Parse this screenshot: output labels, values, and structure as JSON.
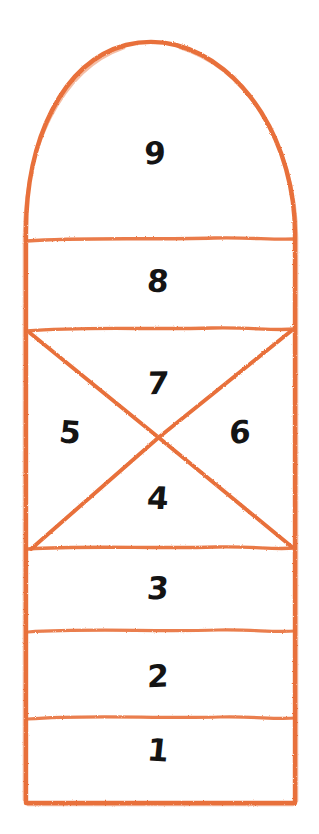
{
  "diagram": {
    "ink_color": "#E8703A",
    "number_color": "#141414",
    "background_color": "#FFFFFF",
    "canvas": {
      "width": 319,
      "height": 834
    },
    "cells": [
      {
        "label": "9",
        "x": 155,
        "y": 155,
        "shape": "arched-top",
        "region": "top-arch"
      },
      {
        "label": "8",
        "x": 158,
        "y": 283,
        "shape": "rectangle",
        "region": "single"
      },
      {
        "label": "7",
        "x": 158,
        "y": 385,
        "shape": "triangle-up",
        "region": "x-box-top"
      },
      {
        "label": "5",
        "x": 70,
        "y": 434,
        "shape": "triangle-left",
        "region": "x-box-left"
      },
      {
        "label": "6",
        "x": 240,
        "y": 434,
        "shape": "triangle-right",
        "region": "x-box-right"
      },
      {
        "label": "4",
        "x": 158,
        "y": 500,
        "shape": "triangle-down",
        "region": "x-box-bottom"
      },
      {
        "label": "3",
        "x": 158,
        "y": 590,
        "shape": "rectangle",
        "region": "single"
      },
      {
        "label": "2",
        "x": 158,
        "y": 678,
        "shape": "rectangle",
        "region": "single"
      },
      {
        "label": "1",
        "x": 158,
        "y": 752,
        "shape": "rectangle",
        "region": "single"
      }
    ],
    "geometry": {
      "left_edge_x": 25,
      "right_edge_x": 296,
      "arch_apex_y": 43,
      "bottom_edge_y": 803,
      "dividers_y": [
        240,
        328,
        548,
        631,
        718
      ],
      "x_cross_point": {
        "x": 158,
        "y": 438
      },
      "x_box_top_y": 330,
      "x_box_bottom_y": 548
    }
  }
}
